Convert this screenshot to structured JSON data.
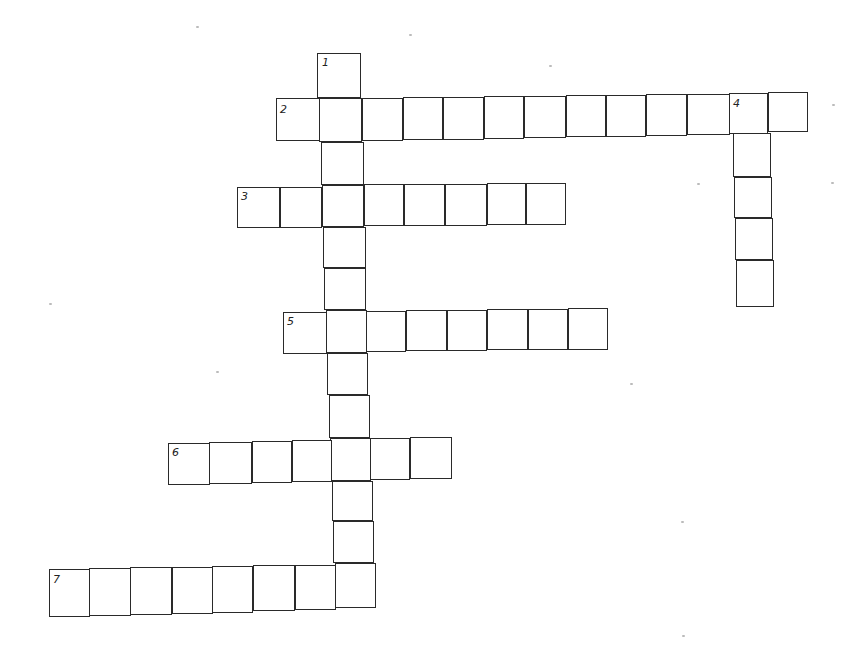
{
  "puzzle": {
    "type": "crossword",
    "line_color": "#2a2a2a",
    "background": "#ffffff",
    "words": [
      {
        "number": "1",
        "direction": "down",
        "length": 13,
        "cells": [
          [
            317,
            53,
            44,
            45
          ],
          [
            319,
            98,
            43,
            44
          ],
          [
            321,
            142,
            43,
            43
          ],
          [
            322,
            185,
            42,
            42
          ],
          [
            323,
            227,
            43,
            41
          ],
          [
            324,
            268,
            42,
            42
          ],
          [
            326,
            310,
            41,
            43
          ],
          [
            327,
            353,
            41,
            42
          ],
          [
            329,
            395,
            41,
            43
          ],
          [
            330,
            438,
            41,
            43
          ],
          [
            332,
            481,
            41,
            40
          ],
          [
            333,
            521,
            41,
            42
          ],
          [
            335,
            563,
            41,
            45
          ]
        ]
      },
      {
        "number": "2",
        "direction": "across",
        "length": 13,
        "cells": [
          [
            276,
            98,
            44,
            43
          ],
          [
            319,
            98,
            43,
            44
          ],
          [
            362,
            98,
            41,
            43
          ],
          [
            403,
            97,
            40,
            43
          ],
          [
            443,
            97,
            41,
            43
          ],
          [
            484,
            96,
            40,
            43
          ],
          [
            524,
            96,
            42,
            42
          ],
          [
            566,
            95,
            40,
            42
          ],
          [
            606,
            95,
            40,
            42
          ],
          [
            646,
            94,
            41,
            42
          ],
          [
            687,
            94,
            43,
            41
          ],
          [
            729,
            93,
            39,
            41
          ],
          [
            768,
            92,
            40,
            40
          ]
        ]
      },
      {
        "number": "3",
        "direction": "across",
        "length": 8,
        "cells": [
          [
            237,
            187,
            43,
            41
          ],
          [
            280,
            187,
            42,
            41
          ],
          [
            322,
            185,
            42,
            42
          ],
          [
            364,
            184,
            40,
            42
          ],
          [
            404,
            184,
            41,
            42
          ],
          [
            445,
            184,
            42,
            42
          ],
          [
            487,
            183,
            39,
            42
          ],
          [
            526,
            183,
            40,
            42
          ]
        ]
      },
      {
        "number": "4",
        "direction": "down",
        "length": 5,
        "cells": [
          [
            729,
            93,
            39,
            41
          ],
          [
            733,
            133,
            38,
            44
          ],
          [
            734,
            177,
            38,
            41
          ],
          [
            735,
            218,
            38,
            42
          ],
          [
            736,
            260,
            38,
            47
          ]
        ]
      },
      {
        "number": "5",
        "direction": "across",
        "length": 8,
        "cells": [
          [
            283,
            312,
            44,
            42
          ],
          [
            326,
            310,
            41,
            43
          ],
          [
            366,
            311,
            40,
            41
          ],
          [
            406,
            310,
            41,
            41
          ],
          [
            447,
            310,
            40,
            41
          ],
          [
            487,
            309,
            41,
            41
          ],
          [
            528,
            309,
            40,
            41
          ],
          [
            568,
            308,
            40,
            42
          ]
        ]
      },
      {
        "number": "6",
        "direction": "across",
        "length": 7,
        "cells": [
          [
            168,
            443,
            42,
            42
          ],
          [
            209,
            442,
            43,
            42
          ],
          [
            252,
            441,
            40,
            42
          ],
          [
            292,
            440,
            40,
            42
          ],
          [
            330,
            438,
            41,
            43
          ],
          [
            370,
            438,
            40,
            42
          ],
          [
            410,
            437,
            42,
            42
          ]
        ]
      },
      {
        "number": "7",
        "direction": "across",
        "length": 8,
        "cells": [
          [
            49,
            569,
            41,
            48
          ],
          [
            89,
            568,
            42,
            48
          ],
          [
            130,
            567,
            42,
            48
          ],
          [
            172,
            567,
            41,
            47
          ],
          [
            212,
            566,
            41,
            47
          ],
          [
            253,
            565,
            42,
            46
          ],
          [
            295,
            565,
            41,
            45
          ],
          [
            335,
            563,
            41,
            45
          ]
        ]
      }
    ],
    "labels": [
      {
        "number": "1",
        "x": 322,
        "y": 57
      },
      {
        "number": "2",
        "x": 280,
        "y": 104
      },
      {
        "number": "3",
        "x": 241,
        "y": 191
      },
      {
        "number": "4",
        "x": 733,
        "y": 98
      },
      {
        "number": "5",
        "x": 287,
        "y": 316
      },
      {
        "number": "6",
        "x": 172,
        "y": 447
      },
      {
        "number": "7",
        "x": 53,
        "y": 574
      }
    ],
    "specks": [
      [
        196,
        26
      ],
      [
        549,
        65
      ],
      [
        697,
        183
      ],
      [
        831,
        182
      ],
      [
        630,
        383
      ],
      [
        49,
        303
      ],
      [
        216,
        371
      ],
      [
        832,
        104
      ],
      [
        681,
        521
      ],
      [
        682,
        635
      ],
      [
        409,
        34
      ]
    ]
  }
}
